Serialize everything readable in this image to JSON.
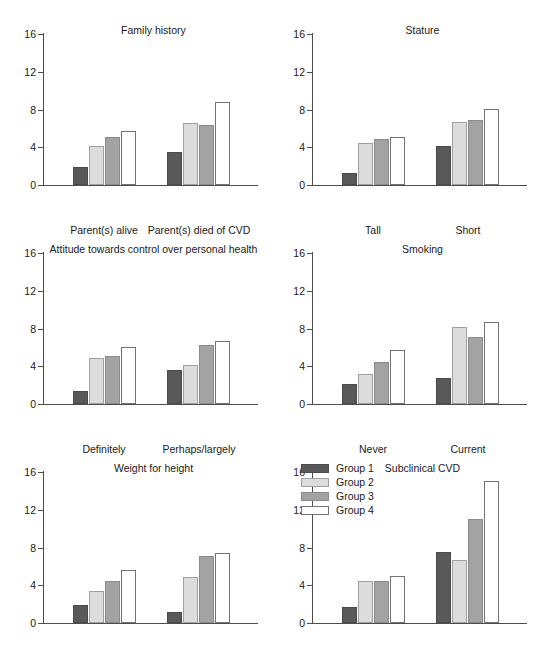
{
  "figure": {
    "layout": "3 rows x 2 columns of grouped bar panels",
    "background": "#ffffff"
  },
  "legend": {
    "position": "top-left of Subclinical CVD panel",
    "entries": [
      {
        "label": "Group 1",
        "color": "#595959"
      },
      {
        "label": "Group 2",
        "color": "#dcdcdc"
      },
      {
        "label": "Group 3",
        "color": "#a3a3a3"
      },
      {
        "label": "Group 4",
        "color": "#ffffff"
      }
    ]
  },
  "axis": {
    "yticks": [
      0,
      4,
      8,
      12,
      16
    ],
    "ytick_labels": [
      "0",
      "4",
      "8",
      "12",
      "16"
    ],
    "ylim": [
      0,
      16
    ]
  },
  "chart_data": [
    {
      "type": "bar",
      "title": "Family history",
      "xlabel": "",
      "ylabel": "",
      "ylim": [
        0,
        16
      ],
      "yticks": [
        0,
        4,
        8,
        12,
        16
      ],
      "grid": false,
      "legend_position": "none",
      "categories": [
        "Parent(s) alive",
        "Parent(s) died of CVD"
      ],
      "series": [
        {
          "name": "Group 1",
          "color": "#595959",
          "values": [
            1.9,
            3.5
          ]
        },
        {
          "name": "Group 2",
          "color": "#dcdcdc",
          "values": [
            4.1,
            6.6
          ]
        },
        {
          "name": "Group 3",
          "color": "#a3a3a3",
          "values": [
            5.1,
            6.4
          ]
        },
        {
          "name": "Group 4",
          "color": "#ffffff",
          "values": [
            5.7,
            8.8
          ]
        }
      ]
    },
    {
      "type": "bar",
      "title": "Stature",
      "xlabel": "",
      "ylabel": "",
      "ylim": [
        0,
        16
      ],
      "yticks": [
        0,
        4,
        8,
        12,
        16
      ],
      "grid": false,
      "legend_position": "none",
      "categories": [
        "Tall",
        "Short"
      ],
      "series": [
        {
          "name": "Group 1",
          "color": "#595959",
          "values": [
            1.3,
            4.1
          ]
        },
        {
          "name": "Group 2",
          "color": "#dcdcdc",
          "values": [
            4.5,
            6.7
          ]
        },
        {
          "name": "Group 3",
          "color": "#a3a3a3",
          "values": [
            4.9,
            6.9
          ]
        },
        {
          "name": "Group 4",
          "color": "#ffffff",
          "values": [
            5.1,
            8.1
          ]
        }
      ]
    },
    {
      "type": "bar",
      "title": "Attitude towards control over personal health",
      "xlabel": "",
      "ylabel": "",
      "ylim": [
        0,
        16
      ],
      "yticks": [
        0,
        4,
        8,
        12,
        16
      ],
      "grid": false,
      "legend_position": "none",
      "categories": [
        "Definitely",
        "Perhaps/largely"
      ],
      "series": [
        {
          "name": "Group 1",
          "color": "#595959",
          "values": [
            1.4,
            3.6
          ]
        },
        {
          "name": "Group 2",
          "color": "#dcdcdc",
          "values": [
            4.9,
            4.1
          ]
        },
        {
          "name": "Group 3",
          "color": "#a3a3a3",
          "values": [
            5.1,
            6.3
          ]
        },
        {
          "name": "Group 4",
          "color": "#ffffff",
          "values": [
            6.0,
            6.7
          ]
        }
      ]
    },
    {
      "type": "bar",
      "title": "Smoking",
      "xlabel": "",
      "ylabel": "",
      "ylim": [
        0,
        16
      ],
      "yticks": [
        0,
        4,
        8,
        12,
        16
      ],
      "grid": false,
      "legend_position": "none",
      "categories": [
        "Never",
        "Current"
      ],
      "series": [
        {
          "name": "Group 1",
          "color": "#595959",
          "values": [
            2.1,
            2.8
          ]
        },
        {
          "name": "Group 2",
          "color": "#dcdcdc",
          "values": [
            3.2,
            8.2
          ]
        },
        {
          "name": "Group 3",
          "color": "#a3a3a3",
          "values": [
            4.5,
            7.1
          ]
        },
        {
          "name": "Group 4",
          "color": "#ffffff",
          "values": [
            5.7,
            8.7
          ]
        }
      ]
    },
    {
      "type": "bar",
      "title": "Weight for height",
      "xlabel": "",
      "ylabel": "",
      "ylim": [
        0,
        16
      ],
      "yticks": [
        0,
        4,
        8,
        12,
        16
      ],
      "grid": false,
      "legend_position": "none",
      "categories": [
        "<24",
        ">27"
      ],
      "series": [
        {
          "name": "Group 1",
          "color": "#595959",
          "values": [
            1.9,
            1.2
          ]
        },
        {
          "name": "Group 2",
          "color": "#dcdcdc",
          "values": [
            3.4,
            4.9
          ]
        },
        {
          "name": "Group 3",
          "color": "#a3a3a3",
          "values": [
            4.4,
            7.1
          ]
        },
        {
          "name": "Group 4",
          "color": "#ffffff",
          "values": [
            5.6,
            7.4
          ]
        }
      ]
    },
    {
      "type": "bar",
      "title": "Subclinical CVD",
      "xlabel": "",
      "ylabel": "",
      "ylim": [
        0,
        16
      ],
      "yticks": [
        0,
        4,
        8,
        12,
        16
      ],
      "grid": false,
      "legend_position": "upper left",
      "categories": [
        "No",
        "Yes"
      ],
      "series": [
        {
          "name": "Group 1",
          "color": "#595959",
          "values": [
            1.7,
            7.5
          ]
        },
        {
          "name": "Group 2",
          "color": "#dcdcdc",
          "values": [
            4.5,
            6.7
          ]
        },
        {
          "name": "Group 3",
          "color": "#a3a3a3",
          "values": [
            4.5,
            11.0
          ]
        },
        {
          "name": "Group 4",
          "color": "#ffffff",
          "values": [
            5.0,
            15.0
          ]
        }
      ]
    }
  ]
}
